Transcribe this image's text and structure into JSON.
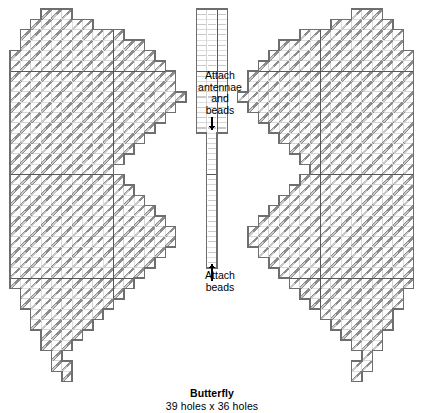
{
  "document": {
    "kind": "needlepoint-pattern-chart",
    "caption_title": "Butterfly",
    "caption_size": "39 holes x 36 holes"
  },
  "annotations": [
    {
      "id": "attach-antennae-and-beads",
      "lines": [
        "Attach",
        "antennae",
        "and",
        "beads"
      ],
      "arrow": "down",
      "arrow_x": 212,
      "arrow_y1": 117,
      "arrow_y2": 130
    },
    {
      "id": "attach-beads",
      "lines": [
        "Attach",
        "beads"
      ],
      "arrow": "up",
      "arrow_x": 212,
      "arrow_y1": 281,
      "arrow_y2": 264
    }
  ],
  "colors": {
    "background": "#ffffff",
    "stitch": "#8c8c8c",
    "stitch_light": "#c9c9c9",
    "cell_grid": "#d2d2d2",
    "outline": "#6e6e6e",
    "section_line": "#4a4a4a",
    "text": "#000000"
  },
  "chart_data": {
    "type": "heatmap",
    "title": "Butterfly",
    "subtitle": "39 holes x 36 holes",
    "xlabel": "",
    "ylabel": "",
    "grid": true,
    "legend": "none",
    "cols": 39,
    "rows": 36,
    "cell_px": 10.35,
    "origin_x": 10,
    "origin_y": 9,
    "section_cols": [
      10,
      20,
      30
    ],
    "section_rows": [
      6,
      16,
      26
    ],
    "stitch_direction": "diagonal-up-right",
    "note": "values[r] is a 39-char row mask: '#'=stitched cell, '.'=empty",
    "values": [
      "...##.........................##......",
      "..####.................||................####.",
      ".########...........||............########.",
      ".##########.......||..........##########.",
      "############.....||........############",
      "#############...||......#############",
      "##############.||.....##############",
      "##############.||.....##############",
      "###############||....###############",
      "##############.||.....##############",
      "#############..||......#############",
      "############...||.......############",
      "###########....||........###########",
      "##########.....||.........##########",
      "#########......||..........#########",
      "########.......||...........########",
      "#########......||..........#########",
      "##########.....||.........##########",
      "###########....||........###########",
      "############...||.......############",
      "#############..||......#############",
      "##############.||.....##############",
      "##############.||.....##############",
      "#############..||......#############",
      "############...||.......############",
      "###########....||........###########",
      "##########.....||.........##########",
      ".#########.....||.........#########.",
      ".########......||..........########.",
      "..######.......||...........######..",
      "..#####........................#####..",
      "...####..........................####...",
      "...###............................###...",
      "....##..............................##....",
      ".....#................................#.....",
      ".....#................................#....."
    ]
  }
}
